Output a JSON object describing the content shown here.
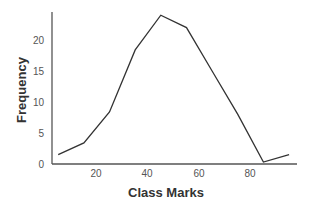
{
  "chart_data": {
    "type": "line",
    "title": "",
    "xlabel": "Class Marks",
    "ylabel": "Frequency",
    "x": [
      5,
      15,
      25,
      35,
      45,
      55,
      65,
      75,
      85,
      95
    ],
    "series": [
      {
        "name": "Frequency",
        "values": [
          1.5,
          3.4,
          8.4,
          18.4,
          24,
          22,
          15,
          8,
          0.3,
          1.5
        ]
      }
    ],
    "xticks": [
      20,
      40,
      60,
      80
    ],
    "yticks": [
      0,
      5,
      10,
      15,
      20
    ],
    "xlim": [
      0,
      97
    ],
    "ylim": [
      0,
      24.5
    ],
    "grid": false,
    "legend": "none",
    "colors": {
      "line": "#333333",
      "axis": "#555555"
    }
  },
  "labels": {
    "xlabel": "Class Marks",
    "ylabel": "Frequency",
    "xticks": [
      "20",
      "40",
      "60",
      "80"
    ],
    "yticks": [
      "0",
      "5",
      "10",
      "15",
      "20"
    ]
  }
}
